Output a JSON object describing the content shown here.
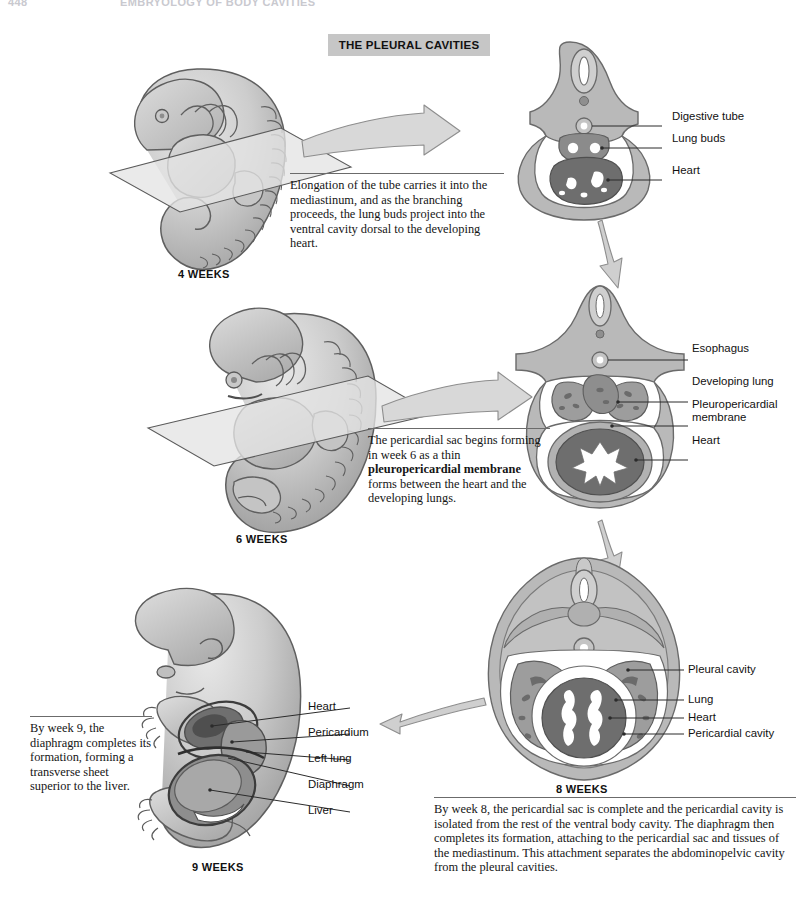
{
  "running_head": {
    "folio": "448",
    "title": "EMBRYOLOGY OF BODY CAVITIES"
  },
  "banner": {
    "title": "THE PLEURAL CAVITIES"
  },
  "stages": [
    {
      "id": "four-weeks",
      "week_label": "4 WEEKS",
      "note": "Elongation of the tube carries it into the mediastinum, and as the branching proceeds, the lung buds project into the ventral cavity dorsal to the developing heart.",
      "labels": [
        "Digestive tube",
        "Lung buds",
        "Heart"
      ]
    },
    {
      "id": "six-weeks",
      "week_label": "6 WEEKS",
      "note_part1": "The pericardial sac begins forming in week 6 as a thin ",
      "note_bold": "pleuropericardial membrane",
      "note_part2": " forms between the heart and the developing lungs.",
      "labels": [
        "Esophagus",
        "Developing lung",
        "Pleuropericardial membrane",
        "Heart"
      ]
    },
    {
      "id": "eight-weeks",
      "week_label": "8 WEEKS",
      "note": "By week 8, the pericardial sac is complete and the pericardial cavity is isolated from the rest of the ventral body cavity. The diaphragm then completes its formation, attaching to the pericardial sac and tissues of the mediastinum. This attachment separates the abdominopelvic cavity from the pleural cavities.",
      "labels": [
        "Pleural cavity",
        "Lung",
        "Heart",
        "Pericardial cavity"
      ]
    },
    {
      "id": "nine-weeks",
      "week_label": "9 WEEKS",
      "note": "By week 9, the diaphragm completes its formation, forming a transverse sheet superior to the liver.",
      "labels": [
        "Heart",
        "Pericardium",
        "Left lung",
        "Diaphragm",
        "Liver"
      ]
    }
  ],
  "colors": {
    "banner_bg": "#c6c6c6",
    "body_wall": "#b9b9b9",
    "body_wall_dark": "#9a9a9a",
    "heart_dark": "#6e6e6e",
    "lung_mid": "#9d9d9d",
    "cavity_white": "#ffffff",
    "outline": "#6b6b6b",
    "arrow_fill": "#d2d2d2",
    "embryo_light": "#d8d8d8",
    "embryo_mid": "#bdbdbd",
    "leader": "#2b2b2b"
  }
}
